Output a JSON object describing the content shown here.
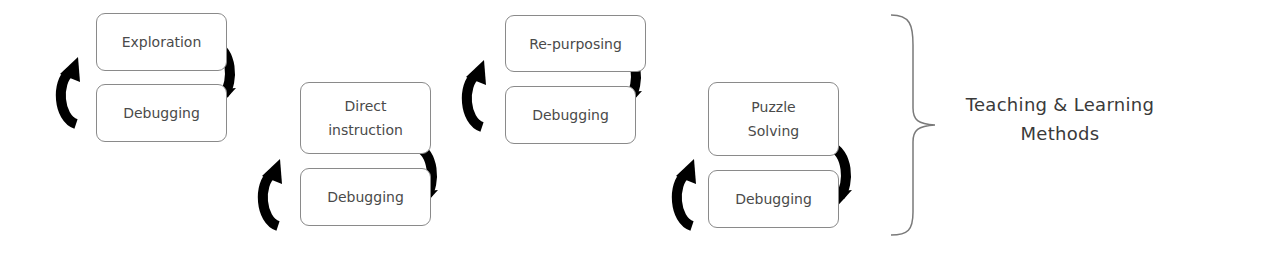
{
  "diagram": {
    "cycles": [
      {
        "method": "Exploration",
        "feedback": "Debugging"
      },
      {
        "method": "Direct\ninstruction",
        "feedback": "Debugging"
      },
      {
        "method": "Re-purposing",
        "feedback": "Debugging"
      },
      {
        "method": "Puzzle\nSolving",
        "feedback": "Debugging"
      }
    ],
    "group_label": "Teaching & Learning\nMethods",
    "colors": {
      "box_border": "#8a8a8a",
      "text": "#4a4a4a",
      "arrow": "#000000",
      "brace": "#7a7a7a"
    }
  }
}
